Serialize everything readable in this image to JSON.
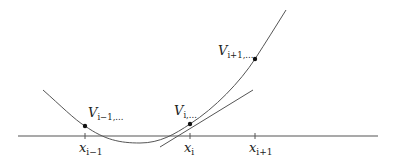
{
  "figure": {
    "type": "diagram",
    "colors": {
      "stroke": "#555555",
      "dot": "#111111",
      "text": "#222222",
      "background": "#ffffff"
    },
    "axis": {
      "y": 136,
      "x_start": 18,
      "x_end": 378
    },
    "ticks": [
      {
        "x": 85,
        "label_main": "x",
        "label_sub": "i−1"
      },
      {
        "x": 190,
        "label_main": "x",
        "label_sub": "i"
      },
      {
        "x": 255,
        "label_main": "x",
        "label_sub": "i+1"
      }
    ],
    "points": [
      {
        "x": 85,
        "y": 126,
        "label_main": "V",
        "label_sub": "i−1,..."
      },
      {
        "x": 190,
        "y": 124,
        "label_main": "V",
        "label_sub": "i,..."
      },
      {
        "x": 255,
        "y": 59,
        "label_main": "V",
        "label_sub": "i+1,..."
      }
    ],
    "curve_path": "M43,90 C60,105 75,120 85,126 C105,140 120,143 140,143 C160,143 175,134 190,124 C215,108 240,82 255,59 C266,42 276,26 286,10",
    "tangent": {
      "x1": 160,
      "y1": 147,
      "x2": 253,
      "y2": 90
    }
  }
}
